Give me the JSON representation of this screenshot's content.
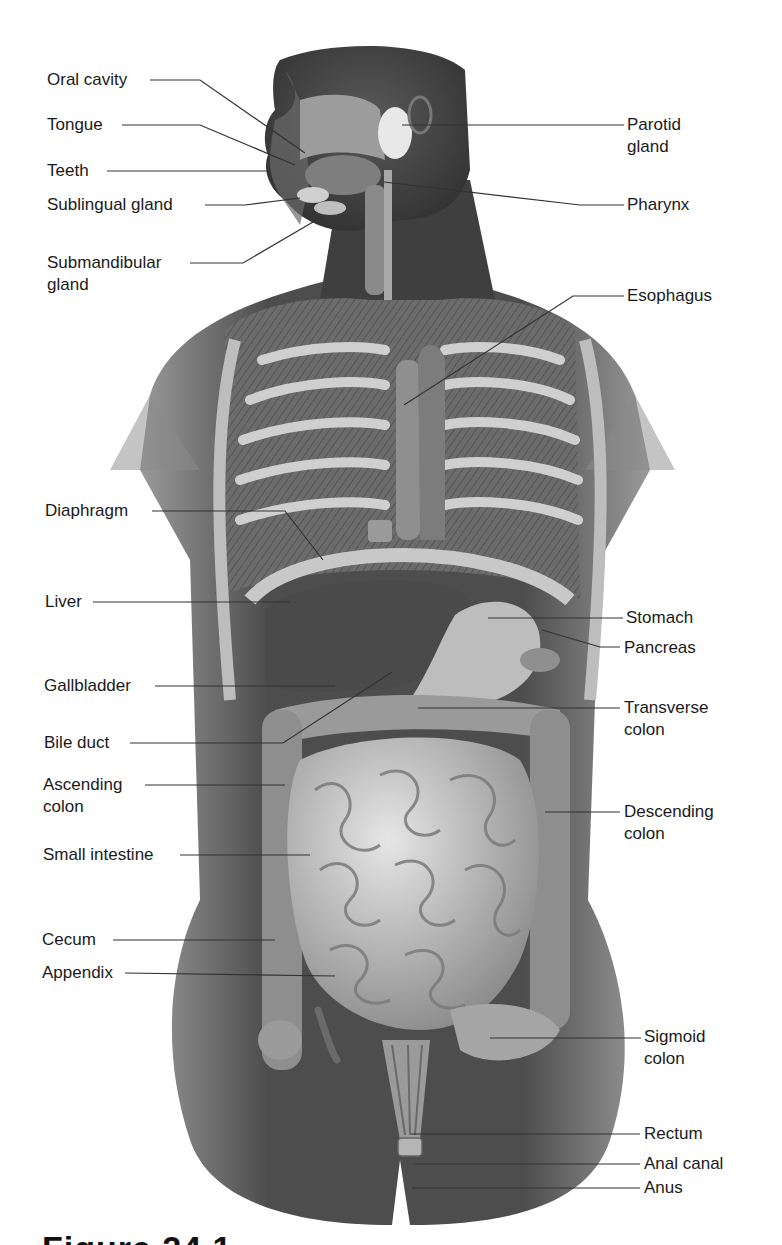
{
  "figure": {
    "caption_fragment": "Figure 24.1",
    "colors": {
      "background": "#ffffff",
      "body_dark": "#4a4a4a",
      "body_mid": "#7a7a7a",
      "organ_light": "#d4d4d4",
      "label_text": "#1a1a1a",
      "leader_line": "#333333"
    }
  },
  "labels_left": [
    {
      "id": "oral-cavity",
      "text": "Oral cavity",
      "line2": ""
    },
    {
      "id": "tongue",
      "text": "Tongue",
      "line2": ""
    },
    {
      "id": "teeth",
      "text": "Teeth",
      "line2": ""
    },
    {
      "id": "sublingual-gland",
      "text": "Sublingual gland",
      "line2": ""
    },
    {
      "id": "submandibular-gland",
      "text": "Submandibular",
      "line2": "gland"
    },
    {
      "id": "diaphragm",
      "text": "Diaphragm",
      "line2": ""
    },
    {
      "id": "liver",
      "text": "Liver",
      "line2": ""
    },
    {
      "id": "gallbladder",
      "text": "Gallbladder",
      "line2": ""
    },
    {
      "id": "bile-duct",
      "text": "Bile duct",
      "line2": ""
    },
    {
      "id": "ascending-colon",
      "text": "Ascending",
      "line2": "colon"
    },
    {
      "id": "small-intestine",
      "text": "Small intestine",
      "line2": ""
    },
    {
      "id": "cecum",
      "text": "Cecum",
      "line2": ""
    },
    {
      "id": "appendix",
      "text": "Appendix",
      "line2": ""
    }
  ],
  "labels_right": [
    {
      "id": "parotid-gland",
      "text": "Parotid",
      "line2": "gland"
    },
    {
      "id": "pharynx",
      "text": "Pharynx",
      "line2": ""
    },
    {
      "id": "esophagus",
      "text": "Esophagus",
      "line2": ""
    },
    {
      "id": "stomach",
      "text": "Stomach",
      "line2": ""
    },
    {
      "id": "pancreas",
      "text": "Pancreas",
      "line2": ""
    },
    {
      "id": "transverse-colon",
      "text": "Transverse",
      "line2": "colon"
    },
    {
      "id": "descending-colon",
      "text": "Descending",
      "line2": "colon"
    },
    {
      "id": "sigmoid-colon",
      "text": "Sigmoid",
      "line2": "colon"
    },
    {
      "id": "rectum",
      "text": "Rectum",
      "line2": ""
    },
    {
      "id": "anal-canal",
      "text": "Anal canal",
      "line2": ""
    },
    {
      "id": "anus",
      "text": "Anus",
      "line2": ""
    }
  ]
}
